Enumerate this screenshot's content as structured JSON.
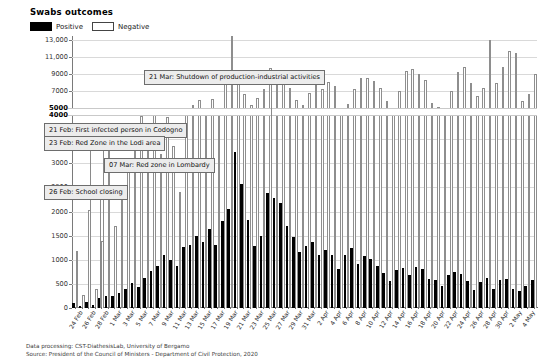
{
  "header": {
    "title": "Swabs outcomes",
    "legend": [
      {
        "label": "Positive",
        "swatch": "black-filled",
        "color": "#000000"
      },
      {
        "label": "Negative",
        "swatch": "white-outlined",
        "color": "#ffffff"
      }
    ]
  },
  "footer": {
    "line1": "Data processing: CST-DiathesisLab, University of Bergamo",
    "line2": "Source: President of the Council of Ministers - Department of Civil Protection, 2020"
  },
  "annotations": [
    {
      "id": "a1",
      "text": "21 Mar: Shutdown of production-industrial activities",
      "target_date": "21 Mar"
    },
    {
      "id": "a2",
      "text": "21 Feb: First infected person in Codogno",
      "target_date": "21 Feb"
    },
    {
      "id": "a3",
      "text": "23 Feb: Red Zone in the Lodi area",
      "target_date": "23 Feb"
    },
    {
      "id": "a4",
      "text": "07 Mar: Red zone in Lombardy",
      "target_date": "07 Mar"
    },
    {
      "id": "a5",
      "text": "26 Feb: School closing",
      "target_date": "26 Feb"
    }
  ],
  "chart_data": {
    "type": "bar",
    "title": "Swabs outcomes",
    "xlabel": "",
    "ylabel": "",
    "grid": true,
    "legend_position": "top-left",
    "y_axis": {
      "broken": true,
      "lower_segment": {
        "min": 0,
        "max": 4000,
        "ticks": [
          0,
          500,
          1000,
          1500,
          2000,
          2500,
          3000,
          3500,
          4000
        ]
      },
      "upper_segment": {
        "min": 5000,
        "max": 13500,
        "ticks": [
          5000,
          7000,
          9000,
          11000,
          13000
        ]
      },
      "tick_labels": [
        "0",
        "500",
        "1000",
        "1500",
        "2000",
        "2500",
        "3000",
        "3500",
        "4000",
        "5000",
        "7000",
        "9000",
        "11,000",
        "13,000"
      ]
    },
    "x_tick_labels": [
      "24 Feb",
      "26 Feb",
      "28 Feb",
      "1 Mar",
      "3 Mar",
      "5 Mar",
      "7 Mar",
      "9 Mar",
      "11 Mar",
      "13 Mar",
      "15 Mar",
      "17 Mar",
      "19 Mar",
      "21 Mar",
      "23 Mar",
      "25 Mar",
      "27 Mar",
      "29 Mar",
      "31 Mar",
      "2 Apr",
      "4 Apr",
      "6 Apr",
      "8 Apr",
      "10 Apr",
      "12 Apr",
      "14 Apr",
      "16 Apr",
      "18 Apr",
      "20 Apr",
      "22 Apr",
      "24 Apr",
      "26 Apr",
      "28 Apr",
      "30 Apr",
      "2 May",
      "4 May"
    ],
    "categories": [
      "24 Feb",
      "25 Feb",
      "26 Feb",
      "27 Feb",
      "28 Feb",
      "29 Feb",
      "1 Mar",
      "2 Mar",
      "3 Mar",
      "4 Mar",
      "5 Mar",
      "6 Mar",
      "7 Mar",
      "8 Mar",
      "9 Mar",
      "10 Mar",
      "11 Mar",
      "12 Mar",
      "13 Mar",
      "14 Mar",
      "15 Mar",
      "16 Mar",
      "17 Mar",
      "18 Mar",
      "19 Mar",
      "20 Mar",
      "21 Mar",
      "22 Mar",
      "23 Mar",
      "24 Mar",
      "25 Mar",
      "26 Mar",
      "27 Mar",
      "28 Mar",
      "29 Mar",
      "30 Mar",
      "31 Mar",
      "1 Apr",
      "2 Apr",
      "3 Apr",
      "4 Apr",
      "5 Apr",
      "6 Apr",
      "7 Apr",
      "8 Apr",
      "9 Apr",
      "10 Apr",
      "11 Apr",
      "12 Apr",
      "13 Apr",
      "14 Apr",
      "15 Apr",
      "16 Apr",
      "17 Apr",
      "18 Apr",
      "19 Apr",
      "20 Apr",
      "21 Apr",
      "22 Apr",
      "23 Apr",
      "24 Apr",
      "25 Apr",
      "26 Apr",
      "27 Apr",
      "28 Apr",
      "29 Apr",
      "30 Apr",
      "1 May",
      "2 May",
      "3 May",
      "4 May",
      "5 May"
    ],
    "series": [
      {
        "name": "Positive",
        "color": "#000000",
        "values": [
          110,
          40,
          130,
          70,
          200,
          250,
          240,
          320,
          390,
          520,
          440,
          620,
          760,
          880,
          1100,
          990,
          880,
          1260,
          1310,
          1500,
          1370,
          1640,
          1310,
          1810,
          2050,
          3230,
          2560,
          1820,
          1290,
          1490,
          2390,
          2280,
          2170,
          1690,
          1480,
          1160,
          1290,
          1370,
          1100,
          1210,
          1100,
          800,
          1090,
          1250,
          910,
          1080,
          1010,
          870,
          730,
          570,
          790,
          830,
          690,
          860,
          800,
          610,
          590,
          460,
          690,
          740,
          710,
          550,
          380,
          530,
          620,
          400,
          590,
          610,
          390,
          350,
          450,
          580
        ]
      },
      {
        "name": "Negative",
        "color": "#ffffff",
        "values": [
          1180,
          260,
          2040,
          400,
          1380,
          3260,
          1700,
          2400,
          3000,
          3250,
          4100,
          3580,
          4300,
          3200,
          3950,
          3350,
          2400,
          4700,
          5400,
          6000,
          5000,
          6100,
          4600,
          7800,
          13500,
          9500,
          6700,
          5400,
          6200,
          7200,
          9700,
          8900,
          9100,
          7400,
          6000,
          5400,
          6800,
          8600,
          7200,
          8100,
          7600,
          4900,
          5500,
          7300,
          8500,
          8600,
          8200,
          7400,
          5800,
          4800,
          7000,
          9400,
          9600,
          9000,
          8300,
          5600,
          5100,
          4300,
          7000,
          9300,
          9900,
          8000,
          6400,
          7400,
          13000,
          8000,
          9900,
          11700,
          11500,
          5800,
          6700,
          9000
        ]
      }
    ]
  }
}
